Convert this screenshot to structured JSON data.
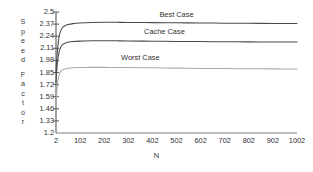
{
  "chart_data": {
    "type": "line",
    "title": "",
    "xlabel": "N",
    "ylabel": "Speed Factor",
    "ylabel_lines": [
      "S",
      "p",
      "e",
      "e",
      "d",
      "F",
      "a",
      "c",
      "t",
      "o",
      "r"
    ],
    "xlim": [
      2,
      1002
    ],
    "ylim": [
      1.2,
      2.5
    ],
    "grid": false,
    "legend_position": "inline-annotations",
    "xticks": [
      2,
      102,
      202,
      302,
      402,
      502,
      602,
      702,
      802,
      902,
      1002
    ],
    "xtick_labels": [
      "2",
      "102",
      "202",
      "302",
      "402",
      "502",
      "602",
      "702",
      "802",
      "902",
      "1002"
    ],
    "yticks": [
      1.2,
      1.33,
      1.46,
      1.59,
      1.72,
      1.85,
      1.98,
      2.11,
      2.24,
      2.37,
      2.5
    ],
    "ytick_labels": [
      "1.2",
      "1.33",
      "1.46",
      "1.59",
      "1.72",
      "1.85",
      "1.98",
      "2.11",
      "2.24",
      "2.37",
      "2.5"
    ],
    "series": [
      {
        "name": "Best Case",
        "label": "Best Case",
        "color": "#4a4a4a",
        "annotation_x": 502,
        "annotation_y": 2.47,
        "x": [
          2,
          6,
          10,
          14,
          18,
          22,
          26,
          32,
          42,
          52,
          72,
          102,
          152,
          202,
          252,
          302,
          402,
          502,
          602,
          702,
          802,
          902,
          1002
        ],
        "y": [
          1.84,
          2.02,
          2.14,
          2.22,
          2.27,
          2.3,
          2.32,
          2.34,
          2.355,
          2.365,
          2.375,
          2.382,
          2.387,
          2.389,
          2.389,
          2.388,
          2.386,
          2.384,
          2.382,
          2.38,
          2.379,
          2.377,
          2.376
        ]
      },
      {
        "name": "Cache Case",
        "label": "Cache Case",
        "color": "#4a4a4a",
        "annotation_x": 452,
        "annotation_y": 2.285,
        "x": [
          2,
          6,
          10,
          14,
          18,
          22,
          26,
          32,
          42,
          52,
          72,
          102,
          152,
          202,
          252,
          302,
          402,
          502,
          602,
          702,
          802,
          902,
          1002
        ],
        "y": [
          1.74,
          1.9,
          2.0,
          2.06,
          2.1,
          2.125,
          2.14,
          2.155,
          2.168,
          2.175,
          2.182,
          2.187,
          2.19,
          2.191,
          2.19,
          2.189,
          2.186,
          2.184,
          2.182,
          2.18,
          2.179,
          2.178,
          2.177
        ]
      },
      {
        "name": "Worst Case",
        "label": "Worst Case",
        "color": "#a8a8a8",
        "annotation_x": 352,
        "annotation_y": 2.01,
        "x": [
          2,
          6,
          10,
          14,
          18,
          22,
          26,
          32,
          42,
          52,
          72,
          102,
          152,
          202,
          252,
          302,
          402,
          502,
          602,
          702,
          802,
          902,
          1002
        ],
        "y": [
          1.5,
          1.66,
          1.76,
          1.81,
          1.845,
          1.862,
          1.872,
          1.882,
          1.89,
          1.895,
          1.9,
          1.903,
          1.905,
          1.905,
          1.904,
          1.903,
          1.9,
          1.897,
          1.894,
          1.892,
          1.89,
          1.889,
          1.888
        ]
      }
    ]
  }
}
